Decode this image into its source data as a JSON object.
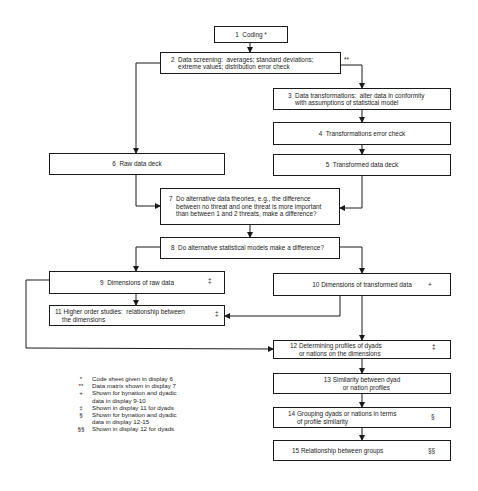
{
  "boxes": {
    "b1": {
      "label": "1  Coding *"
    },
    "b2": {
      "label": "2  Data screening:  averages; standard deviations;\n    extreme values; distribution error check"
    },
    "b3": {
      "label": "3  Data transformations:  alter data in conformity\n    with assumptions of statistical model"
    },
    "b4": {
      "label": "4  Transformations error check"
    },
    "b5": {
      "label": "5  Transformed data deck"
    },
    "b6": {
      "label": "6  Raw data deck"
    },
    "b7": {
      "label": "7  Do alternative data theories, e.g., the difference\n    between no threat and one threat is more important\n    than between 1 and 2 threats, make a difference?"
    },
    "b8": {
      "label": "8  Do alternative statistical models make a difference?"
    },
    "b9": {
      "label": "9  Dimensions of raw data",
      "mark": "‡"
    },
    "b10": {
      "label": "10 Dimensions of transformed data",
      "mark": "+"
    },
    "b11": {
      "label": "11 Higher order studies:  relationship between\n    the dimensions",
      "mark": "‡"
    },
    "b12": {
      "label": "12 Determining profiles of dyads\n     or nations on the dimensions",
      "mark": "‡"
    },
    "b13": {
      "label": "13 Similarity between dyad\n     or nation profiles"
    },
    "b14": {
      "label": "14 Grouping dyads or nations in terms\n     of profile similarity",
      "mark": "§"
    },
    "b15": {
      "label": "15 Relationship between groups",
      "mark": "§§"
    }
  },
  "b2_note": "**",
  "legend": [
    {
      "symbol": "*",
      "text": "Code sheet given in display 6"
    },
    {
      "symbol": "**",
      "text": "Data matrix shown in display 7"
    },
    {
      "symbol": "+",
      "text": "Shown for bynation and dyadic\ndata in display 9-10"
    },
    {
      "symbol": "‡",
      "text": "Shown in display 11 for dyads"
    },
    {
      "symbol": "§",
      "text": "Shown for bynation and dyadic\ndata in display 12-15"
    },
    {
      "symbol": "§§",
      "text": "Shown in display 12 for dyads"
    }
  ]
}
